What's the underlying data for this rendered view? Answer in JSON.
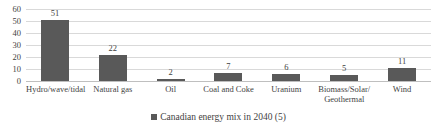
{
  "chart_data": {
    "type": "bar",
    "title": "",
    "xlabel": "",
    "ylabel": "",
    "categories": [
      "Hydro/wave/tidal",
      "Natural gas",
      "Oil",
      "Coal and Coke",
      "Uranium",
      "Biomass/Solar/ Geothermal",
      "Wind"
    ],
    "values": [
      51,
      22,
      2,
      7,
      6,
      5,
      11
    ],
    "data_labels": [
      "51",
      "22",
      "2",
      "7",
      "6",
      "5",
      "11"
    ],
    "series": [
      {
        "name": "Canadian energy mix in 2040 (5)",
        "values": [
          51,
          22,
          2,
          7,
          6,
          5,
          11
        ]
      }
    ],
    "ylim": [
      0,
      60
    ],
    "ytick_labels": [
      "60",
      "50",
      "40",
      "30",
      "20",
      "10",
      "0"
    ],
    "ytick_values": [
      60,
      50,
      40,
      30,
      20,
      10,
      0
    ],
    "grid": true,
    "legend_position": "bottom",
    "bar_color": "#595959",
    "gridline_color": "#d9d9d9",
    "text_color": "#3f3f3f"
  },
  "legend": {
    "items": [
      {
        "label": "Canadian energy mix in 2040 (5)",
        "color": "#595959"
      }
    ]
  }
}
